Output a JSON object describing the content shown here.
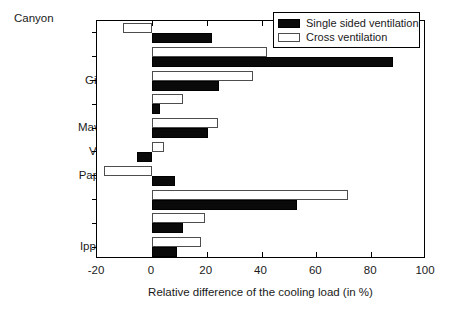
{
  "chart_data": {
    "type": "bar",
    "orientation": "horizontal",
    "title": "",
    "group_label": "Canyon",
    "categories": [
      "Eurota",
      "Omirou",
      "Giannitson",
      "Kodrou",
      "Mavromihail",
      "Valaoritou",
      "Papastratos",
      "Kavalas",
      "Solonos",
      "Ippokratous"
    ],
    "series": [
      {
        "name": "Single sided ventilation",
        "color": "#000000",
        "values": [
          22.0,
          88.0,
          24.5,
          3.0,
          20.5,
          -5.5,
          8.5,
          53.0,
          11.5,
          9.0
        ]
      },
      {
        "name": "Cross ventilation",
        "color": "#ffffff",
        "values": [
          -10.5,
          42.0,
          37.0,
          11.5,
          24.0,
          4.5,
          -17.5,
          71.5,
          19.5,
          18.0
        ]
      }
    ],
    "xlabel": "Relative difference of the cooling load (in %)",
    "ylabel": "",
    "xlim": [
      -20,
      100
    ],
    "xticks": [
      -20,
      0,
      20,
      40,
      60,
      80,
      100
    ],
    "xticklabels": [
      "-20",
      "0",
      "20",
      "40",
      "60",
      "80",
      "100"
    ],
    "grid": false,
    "legend_position": "top-right"
  },
  "legend": {
    "items": [
      {
        "label": "Single sided ventilation",
        "swatch": "black"
      },
      {
        "label": "Cross ventilation",
        "swatch": "white"
      }
    ]
  }
}
